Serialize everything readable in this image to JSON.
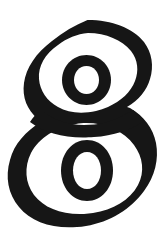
{
  "image": {
    "kind": "scanned-printed-numeral",
    "width": 251,
    "height": 251,
    "canvas_width": 166,
    "background_color": "#ffffff",
    "ink_color": "#161616",
    "description": "Large outlined numeral eight printed in a heavy display typeface on a white page"
  },
  "glyph": {
    "character": "8",
    "name": "numeral-eight",
    "label": "8",
    "style": "outlined-bold-display",
    "stroke_color": "#161616",
    "fill_color": "#ffffff",
    "stroke_width_px": 13,
    "bounds": {
      "left": 16,
      "top": 20,
      "right": 155,
      "bottom": 233
    },
    "counters": [
      {
        "name": "upper-counter",
        "left": 63,
        "top": 55,
        "right": 110,
        "bottom": 105
      },
      {
        "name": "lower-counter",
        "left": 62,
        "top": 140,
        "right": 112,
        "bottom": 201
      }
    ],
    "waist_y": 127
  },
  "artifacts": {
    "left_rule": {
      "name": "page-edge-rule",
      "color": "#565656",
      "x": 5,
      "width": 2,
      "orientation": "vertical",
      "full_height": true
    }
  }
}
